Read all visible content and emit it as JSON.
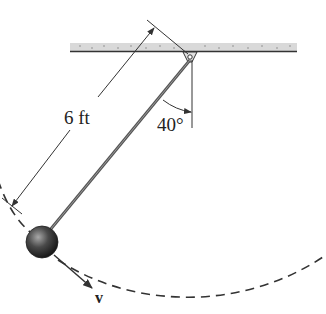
{
  "diagram": {
    "type": "pendulum",
    "labels": {
      "length": "6 ft",
      "angle": "40°",
      "velocity": "v"
    },
    "geometry": {
      "pivot": [
        190,
        60
      ],
      "bob_center": [
        42,
        242
      ],
      "bob_radius": 16,
      "ceiling": {
        "x1": 70,
        "x2": 297,
        "y_top": 43,
        "y_bottom": 52
      },
      "angle_from_vertical_deg": 40
    },
    "colors": {
      "ceiling_fill": "#d8d8d8",
      "ceiling_edge": "#333333",
      "rod": "#555555",
      "bob_dark": "#1a1a1a",
      "bob_light": "#9a9a9a",
      "lines": "#333333",
      "dashed_path": "#333333"
    }
  }
}
